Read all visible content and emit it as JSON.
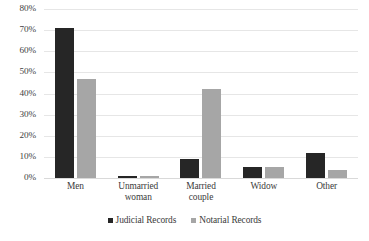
{
  "chart_data": {
    "type": "bar",
    "title": "",
    "xlabel": "",
    "ylabel": "",
    "categories": [
      "Men",
      "Unmarried\nwoman",
      "Married\ncouple",
      "Widow",
      "Other"
    ],
    "series": [
      {
        "name": "Judicial Records",
        "color": "#262626",
        "values": [
          71,
          1,
          9,
          5,
          12
        ]
      },
      {
        "name": "Notarial Records",
        "color": "#a6a6a6",
        "values": [
          47,
          1,
          42,
          5,
          4
        ]
      }
    ],
    "ylim": [
      0,
      80
    ],
    "ytick_values": [
      0,
      10,
      20,
      30,
      40,
      50,
      60,
      70,
      80
    ],
    "ytick_labels": [
      "0%",
      "10%",
      "20%",
      "30%",
      "40%",
      "50%",
      "60%",
      "70%",
      "80%"
    ],
    "grid": "horizontal",
    "legend_position": "bottom-center",
    "background": "#ffffff"
  }
}
